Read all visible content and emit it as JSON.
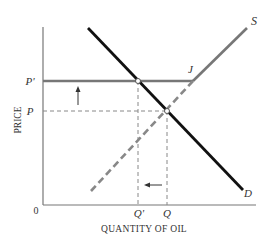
{
  "diagram": {
    "ylabel": "PRICE",
    "xlabel": "QUANTITY OF OIL",
    "origin": "0",
    "price_labels": {
      "p_prime": "P'",
      "p": "P"
    },
    "quantity_labels": {
      "q_prime": "Q'",
      "q": "Q"
    },
    "curve_labels": {
      "supply": "S",
      "demand": "D",
      "kink": "J"
    },
    "colors": {
      "demand": "#111111",
      "supply": "#777777",
      "axis": "#666666",
      "guide": "#777777"
    }
  }
}
